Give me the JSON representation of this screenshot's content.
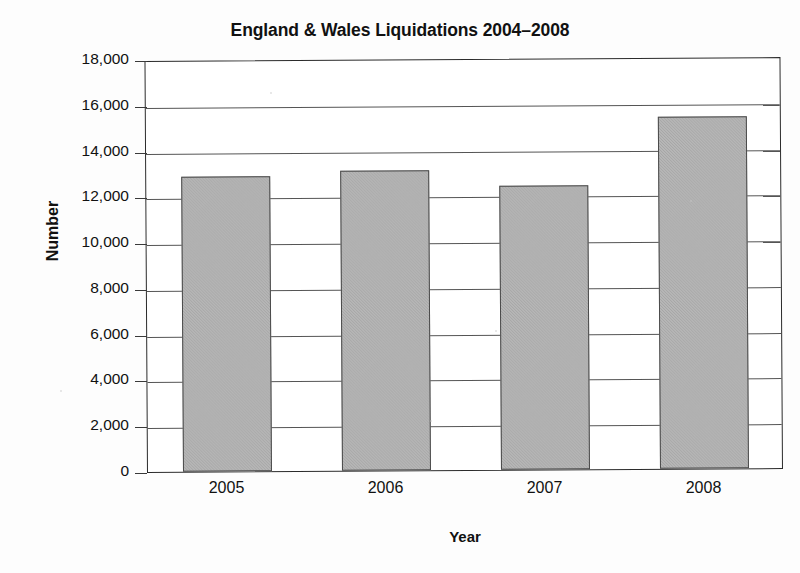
{
  "chart_data": {
    "type": "bar",
    "title": "England & Wales Liquidations 2004–2008",
    "xlabel": "Year",
    "ylabel": "Number",
    "categories": [
      "2005",
      "2006",
      "2007",
      "2008"
    ],
    "values": [
      12900,
      13100,
      12400,
      15400
    ],
    "series": [
      {
        "name": "Liquidations",
        "values": [
          12900,
          13100,
          12400,
          15400
        ]
      }
    ],
    "ylim": [
      0,
      18000
    ],
    "ytick_step": 2000,
    "ytick_labels": [
      "0",
      "2,000",
      "4,000",
      "6,000",
      "8,000",
      "10,000",
      "12,000",
      "14,000",
      "16,000",
      "18,000"
    ],
    "ytick_values": [
      0,
      2000,
      4000,
      6000,
      8000,
      10000,
      12000,
      14000,
      16000,
      18000
    ],
    "grid": "horizontal",
    "legend": "none",
    "bar_color": "#a9a9a9",
    "bar_border_color": "#4a4a4a",
    "axis_color": "#2b2b2b",
    "gridline_color": "#555555",
    "background": "#ffffff"
  }
}
